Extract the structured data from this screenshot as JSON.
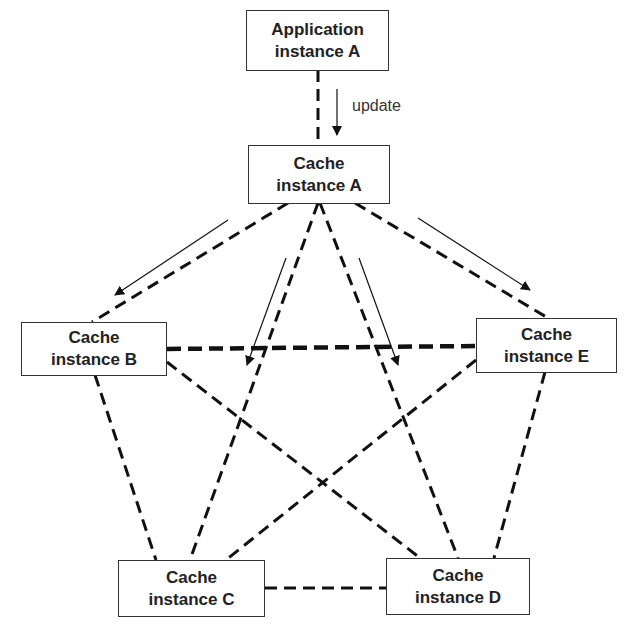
{
  "diagram": {
    "nodes": {
      "app_a": {
        "line1": "Application",
        "line2": "instance A"
      },
      "cache_a": {
        "line1": "Cache",
        "line2": "instance A"
      },
      "cache_b": {
        "line1": "Cache",
        "line2": "instance B"
      },
      "cache_c": {
        "line1": "Cache",
        "line2": "instance C"
      },
      "cache_d": {
        "line1": "Cache",
        "line2": "instance D"
      },
      "cache_e": {
        "line1": "Cache",
        "line2": "instance E"
      }
    },
    "update_label": "update",
    "edges": [
      {
        "from": "app_a",
        "to": "cache_a",
        "style": "dashed"
      },
      {
        "from": "cache_a",
        "to": "cache_b",
        "style": "dashed"
      },
      {
        "from": "cache_a",
        "to": "cache_e",
        "style": "dashed"
      },
      {
        "from": "cache_a",
        "to": "cache_c",
        "style": "dashed"
      },
      {
        "from": "cache_a",
        "to": "cache_d",
        "style": "dashed"
      },
      {
        "from": "cache_b",
        "to": "cache_e",
        "style": "dashed-bold"
      },
      {
        "from": "cache_b",
        "to": "cache_c",
        "style": "dashed"
      },
      {
        "from": "cache_b",
        "to": "cache_d",
        "style": "dashed"
      },
      {
        "from": "cache_e",
        "to": "cache_c",
        "style": "dashed"
      },
      {
        "from": "cache_e",
        "to": "cache_d",
        "style": "dashed"
      },
      {
        "from": "cache_c",
        "to": "cache_d",
        "style": "dashed"
      }
    ],
    "arrows": [
      {
        "label": "update",
        "from": "app_a",
        "to": "cache_a"
      },
      {
        "from": "cache_a",
        "to": "cache_b"
      },
      {
        "from": "cache_a",
        "to": "cache_c"
      },
      {
        "from": "cache_a",
        "to": "cache_d"
      },
      {
        "from": "cache_a",
        "to": "cache_e"
      }
    ]
  }
}
